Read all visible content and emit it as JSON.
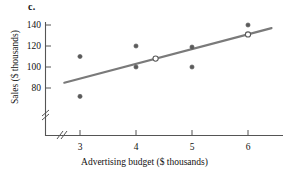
{
  "figure": {
    "part_label": "c.",
    "background_color": "#ffffff"
  },
  "chart_data": {
    "type": "scatter",
    "title": "",
    "xlabel": "Advertising budget ($ thousands)",
    "ylabel": "Sales ($ thousands)",
    "xlim": [
      2.55,
      6.55
    ],
    "ylim": [
      66,
      146
    ],
    "xticks": [
      3,
      4,
      5,
      6
    ],
    "xtick_labels": [
      "3",
      "4",
      "5",
      "6"
    ],
    "yticks": [
      80,
      100,
      120,
      140
    ],
    "ytick_labels": [
      "80",
      "100",
      "120",
      "140"
    ],
    "grid": false,
    "legend": null,
    "axis_break_x": true,
    "axis_break_y": true,
    "marker_color": "#5a5a5a",
    "line_color": "#7a7a7a",
    "axis_color": "#555555",
    "points": [
      {
        "x": 3.0,
        "y": 110,
        "style": "filled"
      },
      {
        "x": 3.0,
        "y": 72,
        "style": "filled"
      },
      {
        "x": 4.0,
        "y": 120,
        "style": "filled"
      },
      {
        "x": 4.0,
        "y": 100,
        "style": "filled"
      },
      {
        "x": 5.0,
        "y": 119,
        "style": "filled"
      },
      {
        "x": 5.0,
        "y": 100,
        "style": "filled"
      },
      {
        "x": 6.0,
        "y": 140,
        "style": "filled"
      }
    ],
    "highlight_points": [
      {
        "x": 4.35,
        "y": 108,
        "style": "open"
      },
      {
        "x": 6.0,
        "y": 131,
        "style": "open"
      }
    ],
    "trend_line": {
      "x_start": 2.72,
      "y_start": 85,
      "x_end": 6.42,
      "y_end": 137
    }
  },
  "axis_labels": {
    "y": [
      "140",
      "120",
      "100",
      "80"
    ],
    "x": [
      "3",
      "4",
      "5",
      "6"
    ]
  }
}
